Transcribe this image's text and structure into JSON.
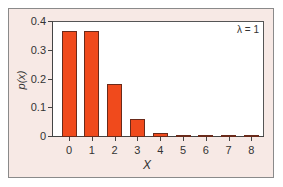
{
  "chart_data": {
    "type": "bar",
    "title": "",
    "annotation": "λ = 1",
    "xlabel": "X",
    "ylabel": "p(x)",
    "categories": [
      "0",
      "1",
      "2",
      "3",
      "4",
      "5",
      "6",
      "7",
      "8"
    ],
    "values": [
      0.368,
      0.368,
      0.184,
      0.061,
      0.015,
      0.003,
      0.0005,
      0.0001,
      1e-05
    ],
    "ylim": [
      0,
      0.4
    ],
    "yticks": [
      "0",
      "0.1",
      "0.2",
      "0.3",
      "0.4"
    ],
    "grid": false,
    "bar_color": "#f04a1c"
  }
}
